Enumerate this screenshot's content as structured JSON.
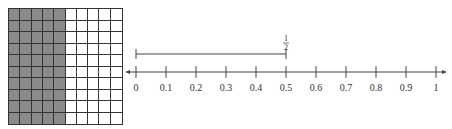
{
  "grid": {
    "rows": 10,
    "columns": 10,
    "shaded_columns": 5,
    "shaded_color": "#8a8a8a",
    "line_color": "#333333"
  },
  "number_line": {
    "ticks": [
      "0",
      "0.1",
      "0.2",
      "0.3",
      "0.4",
      "0.5",
      "0.6",
      "0.7",
      "0.8",
      "0.9",
      "1"
    ],
    "arrows": "both"
  },
  "bracket": {
    "from": "0",
    "to": "0.5",
    "label_numerator": "1",
    "label_denominator": "2"
  }
}
